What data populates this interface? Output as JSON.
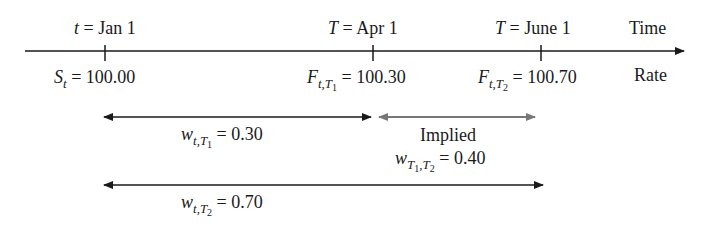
{
  "timeline": {
    "axis_label_top": "Time",
    "axis_label_bottom": "Rate",
    "points": [
      {
        "var": "t",
        "date": "Jan 1",
        "rate_symbol": "S",
        "rate_sub": "t",
        "rate_sub_sub": "",
        "rate_value": "100.00"
      },
      {
        "var": "T",
        "date": "Apr 1",
        "rate_symbol": "F",
        "rate_sub": "t,T",
        "rate_sub_sub": "1",
        "rate_value": "100.30"
      },
      {
        "var": "T",
        "date": "June 1",
        "rate_symbol": "F",
        "rate_sub": "t,T",
        "rate_sub_sub": "2",
        "rate_value": "100.70"
      }
    ]
  },
  "spans": [
    {
      "symbol": "w",
      "sub": "t,T",
      "sub_sub": "1",
      "value": "0.30",
      "color": "#1a1a1a"
    },
    {
      "caption": "Implied",
      "symbol": "w",
      "sub_a": "T",
      "sub_a_sub": "1",
      "sub_b": "T",
      "sub_b_sub": "2",
      "value": "0.40",
      "color": "#777777"
    },
    {
      "symbol": "w",
      "sub": "t,T",
      "sub_sub": "2",
      "value": "0.70",
      "color": "#1a1a1a"
    }
  ],
  "eq": "="
}
